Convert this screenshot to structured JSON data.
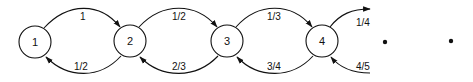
{
  "diagram": {
    "type": "state-transition chain",
    "nodes": [
      {
        "id": "1",
        "label": "1"
      },
      {
        "id": "2",
        "label": "2"
      },
      {
        "id": "3",
        "label": "3"
      },
      {
        "id": "4",
        "label": "4"
      }
    ],
    "edges": [
      {
        "from": "1",
        "to": "2",
        "label": "1"
      },
      {
        "from": "2",
        "to": "1",
        "label": "1/2"
      },
      {
        "from": "2",
        "to": "3",
        "label": "1/2"
      },
      {
        "from": "3",
        "to": "2",
        "label": "2/3"
      },
      {
        "from": "3",
        "to": "4",
        "label": "1/3"
      },
      {
        "from": "4",
        "to": "3",
        "label": "3/4"
      },
      {
        "from": "4",
        "to": "next",
        "label": "1/4"
      },
      {
        "from": "next",
        "to": "4",
        "label": "4/5"
      }
    ],
    "continuation": [
      "•",
      "•"
    ],
    "color": "#111111"
  }
}
